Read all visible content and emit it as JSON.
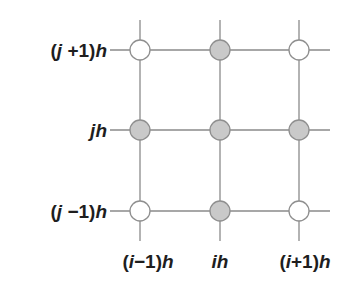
{
  "diagram": {
    "grid": {
      "columns_x": [
        140,
        220,
        299
      ],
      "rows_y": [
        50,
        130,
        211
      ],
      "line_color": "#8a8a8a",
      "node_radius": 10
    },
    "row_labels": [
      {
        "pre": "(",
        "var": "j",
        "mid": " +1)",
        "suf": "h",
        "text": "(j +1)h"
      },
      {
        "pre": "",
        "var": "j",
        "mid": "",
        "suf": "h",
        "text": "jh"
      },
      {
        "pre": "(",
        "var": "j",
        "mid": " −1)",
        "suf": "h",
        "text": "(j −1)h"
      }
    ],
    "column_labels": [
      {
        "pre": "(",
        "var": "i",
        "mid": "−1)",
        "suf": "h",
        "text": "(i−1)h"
      },
      {
        "pre": "",
        "var": "i",
        "mid": "",
        "suf": "h",
        "text": "ih"
      },
      {
        "pre": "(",
        "var": "i",
        "mid": "+1)",
        "suf": "h",
        "text": "(i+1)h"
      }
    ],
    "nodes": [
      {
        "row": 0,
        "col": 0,
        "filled": false
      },
      {
        "row": 0,
        "col": 1,
        "filled": true
      },
      {
        "row": 0,
        "col": 2,
        "filled": false
      },
      {
        "row": 1,
        "col": 0,
        "filled": true
      },
      {
        "row": 1,
        "col": 1,
        "filled": true
      },
      {
        "row": 1,
        "col": 2,
        "filled": true
      },
      {
        "row": 2,
        "col": 0,
        "filled": false
      },
      {
        "row": 2,
        "col": 1,
        "filled": true
      },
      {
        "row": 2,
        "col": 2,
        "filled": false
      }
    ],
    "colors": {
      "filled_node": "#c9c9c9",
      "open_node": "#ffffff",
      "node_stroke": "#8f8f8f",
      "label": "#1e1e1e"
    }
  }
}
